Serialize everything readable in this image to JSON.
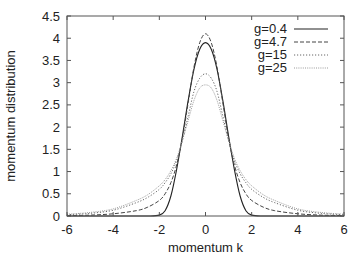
{
  "chart_data": {
    "type": "line",
    "title": "",
    "xlabel": "momentum  k",
    "ylabel": "momentum distribution",
    "xlim": [
      -6,
      6
    ],
    "ylim": [
      0,
      4.5
    ],
    "xticks": [
      -6,
      -4,
      -2,
      0,
      2,
      4,
      6
    ],
    "yticks": [
      0,
      0.5,
      1,
      1.5,
      2,
      2.5,
      3,
      3.5,
      4,
      4.5
    ],
    "xtick_labels": [
      "-6",
      "-4",
      "-2",
      "0",
      "2",
      "4",
      "6"
    ],
    "ytick_labels": [
      "0",
      "0.5",
      "1",
      "1.5",
      "2",
      "2.5",
      "3",
      "3.5",
      "4",
      "4.5"
    ],
    "grid": false,
    "legend_position": "upper right",
    "x": [
      -6,
      -5,
      -4,
      -3,
      -2.5,
      -2,
      -1.75,
      -1.5,
      -1.25,
      -1,
      -0.75,
      -0.5,
      -0.25,
      0,
      0.25,
      0.5,
      0.75,
      1,
      1.25,
      1.5,
      1.75,
      2,
      2.5,
      3,
      4,
      5,
      6
    ],
    "series": [
      {
        "name": "g=0.4",
        "style": "solid",
        "values": [
          0,
          0,
          0,
          0,
          0,
          0.02,
          0.12,
          0.45,
          1.05,
          1.8,
          2.6,
          3.3,
          3.75,
          3.9,
          3.75,
          3.3,
          2.6,
          1.8,
          1.05,
          0.45,
          0.12,
          0.02,
          0,
          0,
          0,
          0,
          0
        ]
      },
      {
        "name": "g=4.7",
        "style": "dashed",
        "values": [
          0.01,
          0.02,
          0.05,
          0.12,
          0.2,
          0.35,
          0.5,
          0.75,
          1.15,
          1.75,
          2.55,
          3.35,
          3.9,
          4.1,
          3.9,
          3.35,
          2.55,
          1.75,
          1.15,
          0.75,
          0.5,
          0.35,
          0.2,
          0.12,
          0.05,
          0.02,
          0.01
        ]
      },
      {
        "name": "g=15",
        "style": "dotted",
        "values": [
          0.03,
          0.06,
          0.13,
          0.3,
          0.42,
          0.6,
          0.75,
          0.95,
          1.25,
          1.7,
          2.25,
          2.8,
          3.1,
          3.2,
          3.1,
          2.8,
          2.25,
          1.7,
          1.25,
          0.95,
          0.75,
          0.6,
          0.42,
          0.3,
          0.13,
          0.06,
          0.03
        ]
      },
      {
        "name": "g=25",
        "style": "dotted-light",
        "values": [
          0.04,
          0.08,
          0.16,
          0.35,
          0.48,
          0.68,
          0.82,
          1.02,
          1.3,
          1.7,
          2.15,
          2.6,
          2.88,
          2.95,
          2.88,
          2.6,
          2.15,
          1.7,
          1.3,
          1.02,
          0.82,
          0.68,
          0.48,
          0.35,
          0.16,
          0.08,
          0.04
        ]
      }
    ]
  },
  "colors": {
    "frame": "#555555",
    "g04": "#222222",
    "g47": "#444444",
    "g15": "#666666",
    "g25": "#999999"
  }
}
